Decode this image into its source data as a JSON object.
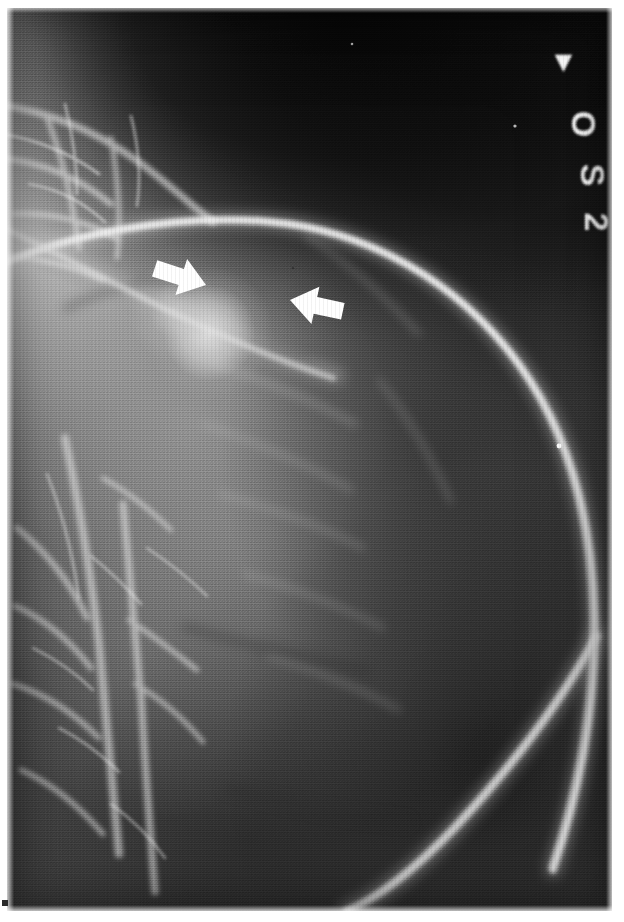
{
  "image": {
    "kind": "radiograph",
    "modality_hint": "pulmonary angiogram / chest radiograph detail",
    "orientation": "portrait",
    "background_color": "#ffffff",
    "film_tone_dark": "#0c0c0c",
    "film_tone_mid": "#6f6f6f",
    "film_tone_light": "#f2f2f2"
  },
  "markers": {
    "description": "Radiopaque lead markers in upper-right of the film, characters rotated 90 degrees clockwise",
    "glyphs": [
      {
        "name": "marker-caret",
        "char": "▶",
        "x": 558,
        "y": 62,
        "rotation": 90,
        "size": 20
      },
      {
        "name": "marker-letter-o",
        "char": "O",
        "x": 572,
        "y": 122,
        "rotation": 90,
        "size": 30
      },
      {
        "name": "marker-letter-s",
        "char": "S",
        "x": 580,
        "y": 172,
        "rotation": 90,
        "size": 30
      },
      {
        "name": "marker-digit-2",
        "char": "2",
        "x": 583,
        "y": 218,
        "rotation": 90,
        "size": 30
      }
    ],
    "reading": "OS 2"
  },
  "annotations": {
    "arrows": [
      {
        "name": "left-annotation-arrow",
        "color": "#ffffff",
        "tip_x": 199,
        "tip_y": 277,
        "direction": "points right and slightly down",
        "rotation": 18,
        "length": 56
      },
      {
        "name": "right-annotation-arrow",
        "color": "#ffffff",
        "tip_x": 283,
        "tip_y": 292,
        "direction": "points left and slightly up",
        "rotation": 192,
        "length": 52
      }
    ],
    "points_to": "lesion / filling defect adjacent to the opacified vessel"
  },
  "features": [
    {
      "name": "catheter-arc",
      "description": "large bright opacified arc sweeping from upper-left across the top and down the right margin",
      "brightness": "#dedede"
    },
    {
      "name": "descending-vessel",
      "description": "bright linear opacity continuing from lower-right toward the bottom edge",
      "brightness": "#cfcfcf"
    },
    {
      "name": "vascular-tree-left",
      "description": "branching bright vascular network occupying the left third of the film",
      "brightness": "#e8e8e8"
    },
    {
      "name": "hilar-mass",
      "description": "bright lobulated rounded opacity indicated by the paired arrows",
      "brightness": "#f0f0f0"
    },
    {
      "name": "dark-apex",
      "description": "dense black region in the upper-right corner beyond the lung field",
      "brightness": "#0b0b0b"
    }
  ],
  "registration_mark": {
    "name": "corner-registration-dot",
    "color": "#2b2b2b",
    "x": 2,
    "y": 900
  }
}
